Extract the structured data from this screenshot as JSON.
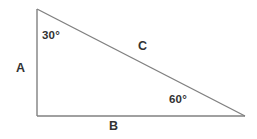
{
  "figure": {
    "kind": "geometry-diagram",
    "shape": "right-triangle",
    "background_color": "#ffffff",
    "line_color": "#808080",
    "text_color": "#333333",
    "width": 257,
    "height": 139,
    "vertices": {
      "apex": {
        "x": 37,
        "y": 9
      },
      "bottom_left": {
        "x": 37,
        "y": 116
      },
      "bottom_right": {
        "x": 245,
        "y": 116
      }
    },
    "angles": {
      "top": "30°",
      "bottom_right": "60°"
    },
    "sides": {
      "left_leg": "A",
      "base": "B",
      "hypotenuse": "C"
    }
  }
}
